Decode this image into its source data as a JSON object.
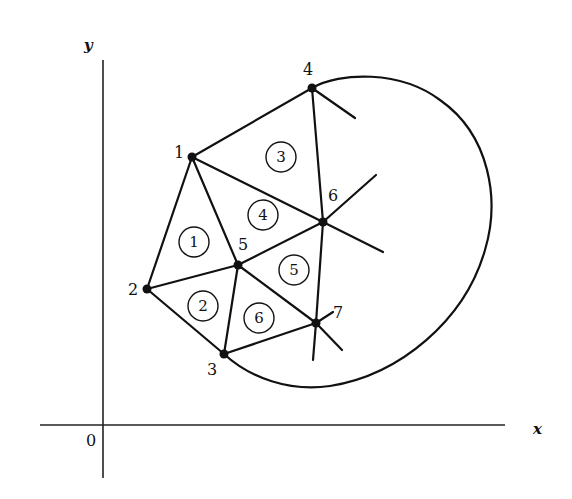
{
  "diagram": {
    "type": "finite-element-mesh",
    "axes": {
      "x_label": "x",
      "y_label": "y",
      "origin_label": "0"
    },
    "nodes": [
      {
        "id": "1",
        "label": "1",
        "x": 192,
        "y": 157
      },
      {
        "id": "2",
        "label": "2",
        "x": 147,
        "y": 289
      },
      {
        "id": "3",
        "label": "3",
        "x": 224,
        "y": 354
      },
      {
        "id": "4",
        "label": "4",
        "x": 312,
        "y": 88
      },
      {
        "id": "5",
        "label": "5",
        "x": 238,
        "y": 265
      },
      {
        "id": "6",
        "label": "6",
        "x": 323,
        "y": 222
      },
      {
        "id": "7",
        "label": "7",
        "x": 316,
        "y": 323
      }
    ],
    "elements": [
      {
        "label": "1",
        "nodes": [
          "1",
          "2",
          "5"
        ]
      },
      {
        "label": "2",
        "nodes": [
          "2",
          "3",
          "5"
        ]
      },
      {
        "label": "3",
        "nodes": [
          "1",
          "4",
          "6"
        ]
      },
      {
        "label": "4",
        "nodes": [
          "1",
          "5",
          "6"
        ]
      },
      {
        "label": "5",
        "nodes": [
          "5",
          "6",
          "7"
        ]
      },
      {
        "label": "6",
        "nodes": [
          "3",
          "5",
          "7"
        ]
      }
    ],
    "boundary": "closed curve through nodes 3 and 4 enclosing the mesh"
  }
}
